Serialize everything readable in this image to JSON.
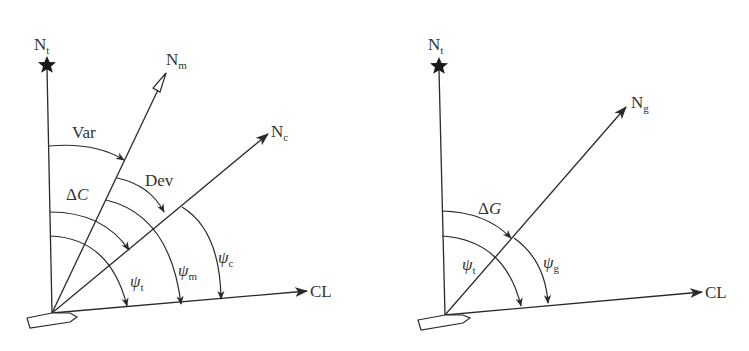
{
  "figure": {
    "colors": {
      "ink": "#2a2a2a",
      "background": "#ffffff",
      "text": "#333333"
    },
    "left_diagram": {
      "title_star_label": {
        "base": "N",
        "sub": "t"
      },
      "magnetic_north": {
        "base": "N",
        "sub": "m"
      },
      "compass_north": {
        "base": "N",
        "sub": "c"
      },
      "centerline": "CL",
      "angles": {
        "variation": "Var",
        "deviation": "Dev",
        "compass_error": {
          "delta": "Δ",
          "symbol": "C"
        },
        "true_heading": {
          "base": "ψ",
          "sub": "t"
        },
        "magnetic_heading": {
          "base": "ψ",
          "sub": "m"
        },
        "compass_heading": {
          "base": "ψ",
          "sub": "c"
        }
      },
      "icons": [
        "star-icon",
        "compass-needle-icon",
        "ship-icon"
      ]
    },
    "right_diagram": {
      "title_star_label": {
        "base": "N",
        "sub": "t"
      },
      "gyro_north": {
        "base": "N",
        "sub": "g"
      },
      "centerline": "CL",
      "angles": {
        "gyro_error": {
          "delta": "Δ",
          "symbol": "G"
        },
        "true_heading": {
          "base": "ψ",
          "sub": "t"
        },
        "gyro_heading": {
          "base": "ψ",
          "sub": "g"
        }
      },
      "icons": [
        "star-icon",
        "ship-icon"
      ]
    }
  }
}
